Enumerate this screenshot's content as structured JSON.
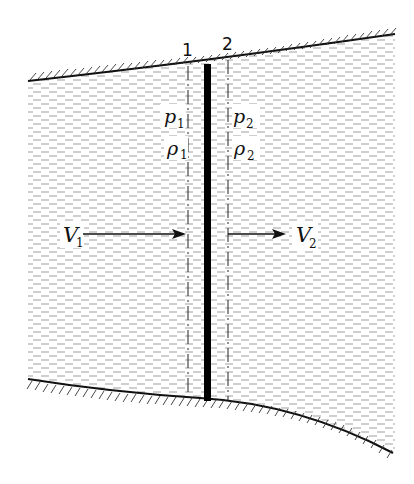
{
  "diagram": {
    "stations": [
      {
        "id": "1",
        "label": "1",
        "pressure": "p",
        "pressure_sub": "1",
        "density": "ρ",
        "density_sub": "1",
        "velocity": "V",
        "velocity_sub": "1"
      },
      {
        "id": "2",
        "label": "2",
        "pressure": "p",
        "pressure_sub": "2",
        "density": "ρ",
        "density_sub": "2",
        "velocity": "V",
        "velocity_sub": "2"
      }
    ],
    "colors": {
      "ink": "#111111",
      "fluid_dash": "#9a9a9a",
      "background": "#ffffff"
    }
  }
}
